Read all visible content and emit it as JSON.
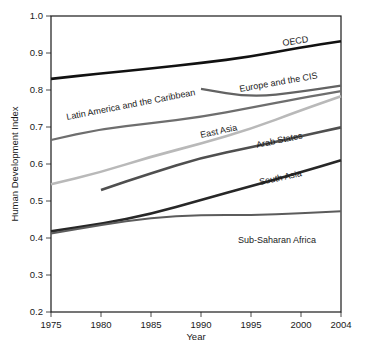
{
  "chart_data": {
    "type": "line",
    "title": "",
    "xlabel": "Year",
    "ylabel": "Human Development Index",
    "xlim": [
      1975,
      2004
    ],
    "ylim": [
      0.2,
      1.0
    ],
    "grid": false,
    "legend_position": "inline-annotations",
    "xticks": [
      "1975",
      "1980",
      "1985",
      "1990",
      "1995",
      "2000",
      "2004"
    ],
    "xtick_values": [
      1975,
      1980,
      1985,
      1990,
      1995,
      2000,
      2004
    ],
    "yticks": [
      "0.2",
      "0.3",
      "0.4",
      "0.5",
      "0.6",
      "0.7",
      "0.8",
      "0.9",
      "1.0"
    ],
    "ytick_values": [
      0.2,
      0.3,
      0.4,
      0.5,
      0.6,
      0.7,
      0.8,
      0.9,
      1.0
    ],
    "series": [
      {
        "name": "OECD",
        "label": "OECD",
        "color": "#111111",
        "width": 2.6,
        "x": [
          1975,
          1980,
          1985,
          1990,
          1995,
          2000,
          2004
        ],
        "values": [
          0.83,
          0.845,
          0.858,
          0.873,
          0.89,
          0.915,
          0.932
        ]
      },
      {
        "name": "Europe and the CIS",
        "label": "Europe and the CIS",
        "color": "#636363",
        "width": 2.2,
        "x": [
          1990,
          1995,
          2000,
          2004
        ],
        "values": [
          0.803,
          0.78,
          0.795,
          0.812
        ]
      },
      {
        "name": "Latin America and the Caribbean",
        "label": "Latin America and the Caribbean",
        "color": "#6e6e6e",
        "width": 2.2,
        "x": [
          1975,
          1980,
          1985,
          1990,
          1995,
          2000,
          2004
        ],
        "values": [
          0.665,
          0.695,
          0.71,
          0.727,
          0.752,
          0.778,
          0.797
        ]
      },
      {
        "name": "East Asia",
        "label": "East Asia",
        "color": "#b9b9b9",
        "width": 2.6,
        "x": [
          1975,
          1980,
          1985,
          1990,
          1995,
          2000,
          2004
        ],
        "values": [
          0.545,
          0.578,
          0.62,
          0.655,
          0.695,
          0.745,
          0.783
        ]
      },
      {
        "name": "Arab States",
        "label": "Arab States",
        "color": "#4f4f4f",
        "width": 2.6,
        "x": [
          1980,
          1985,
          1990,
          1995,
          2000,
          2004
        ],
        "values": [
          0.53,
          0.575,
          0.617,
          0.645,
          0.675,
          0.699
        ]
      },
      {
        "name": "South Asia",
        "label": "South Asia",
        "color": "#272727",
        "width": 2.6,
        "x": [
          1975,
          1980,
          1985,
          1990,
          1995,
          2000,
          2004
        ],
        "values": [
          0.418,
          0.438,
          0.465,
          0.503,
          0.54,
          0.578,
          0.61
        ]
      },
      {
        "name": "Sub-Saharan Africa",
        "label": "Sub-Saharan Africa",
        "color": "#5c5c5c",
        "width": 2.0,
        "x": [
          1975,
          1980,
          1985,
          1990,
          1995,
          2000,
          2004
        ],
        "values": [
          0.412,
          0.435,
          0.455,
          0.462,
          0.462,
          0.467,
          0.472
        ]
      }
    ],
    "annotations": [
      {
        "series": "OECD",
        "text": "OECD",
        "x": 283,
        "y": 46,
        "rotate": -9,
        "color": "#141414"
      },
      {
        "series": "Europe and the CIS",
        "text": "Europe and the CIS",
        "x": 240,
        "y": 92,
        "rotate": -10,
        "color": "#4a4a4a"
      },
      {
        "series": "Latin America and the Caribbean",
        "text": "Latin America and the Caribbean",
        "x": 67,
        "y": 120,
        "rotate": -11,
        "color": "#565656"
      },
      {
        "series": "East Asia",
        "text": "East Asia",
        "x": 201,
        "y": 138,
        "rotate": -12,
        "color": "#a5a5a5"
      },
      {
        "series": "Arab States",
        "text": "Arab States",
        "x": 257,
        "y": 148,
        "rotate": -12,
        "color": "#3c3c3c"
      },
      {
        "series": "South Asia",
        "text": "South Asia",
        "x": 260,
        "y": 185,
        "rotate": -12,
        "color": "#1f1f1f"
      },
      {
        "series": "Sub-Saharan Africa",
        "text": "Sub-Saharan Africa",
        "x": 238,
        "y": 243,
        "rotate": 0,
        "color": "#4a4a4a"
      }
    ]
  },
  "axes": {
    "y_title": "Human Development Index",
    "x_title": "Year"
  }
}
